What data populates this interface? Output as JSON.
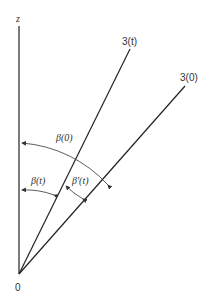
{
  "diagram": {
    "axis_label": "z",
    "origin_label": "0",
    "lines": [
      {
        "name": "z-axis",
        "label": "z"
      },
      {
        "name": "line-3t",
        "label": "3(t)"
      },
      {
        "name": "line-30",
        "label": "3(0)"
      }
    ],
    "angles": [
      {
        "name": "beta-0",
        "label": "β(0)"
      },
      {
        "name": "beta-t-left",
        "label": "β(t)"
      },
      {
        "name": "beta-t-right",
        "label": "β'(t)"
      }
    ]
  }
}
